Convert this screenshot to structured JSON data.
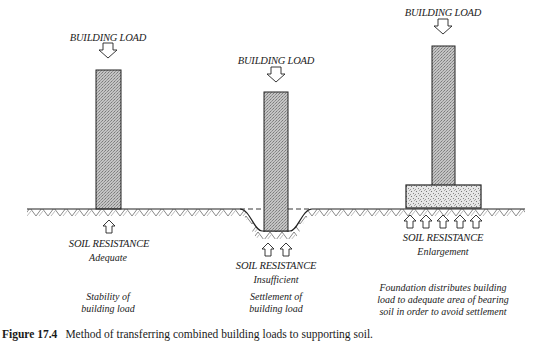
{
  "panels": [
    {
      "id": "adequate",
      "building_load_label": "BUILDING LOAD",
      "soil_resistance_label": "SOIL RESISTANCE",
      "soil_resistance_qualifier": "Adequate",
      "description_lines": [
        "Stability of",
        "building load"
      ]
    },
    {
      "id": "insufficient",
      "building_load_label": "BUILDING LOAD",
      "soil_resistance_label": "SOIL RESISTANCE",
      "soil_resistance_qualifier": "Insufficient",
      "description_lines": [
        "Settlement of",
        "building load"
      ]
    },
    {
      "id": "enlargement",
      "building_load_label": "BUILDING LOAD",
      "soil_resistance_label": "SOIL RESISTANCE",
      "soil_resistance_qualifier": "Enlargement",
      "description_lines": [
        "Foundation distributes building",
        "load to adequate area of bearing",
        "soil in order to avoid settlement"
      ]
    }
  ],
  "caption": {
    "figure_number": "Figure 17.4",
    "text": "Method of transferring combined building loads to supporting soil."
  },
  "colors": {
    "column_fill": "#b3b3b3",
    "footing_fill": "#dcdcdc",
    "line": "#222222"
  },
  "icons": {
    "load_arrow": "down-arrow-outline-icon",
    "resistance_arrow": "up-arrow-outline-icon",
    "soil_hatch": "earth-hatch-pattern"
  }
}
